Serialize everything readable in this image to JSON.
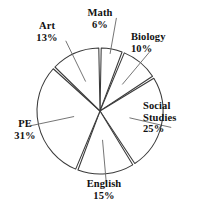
{
  "chart_data": {
    "type": "pie",
    "title": "",
    "categories": [
      "Math",
      "Biology",
      "Social Studies",
      "English",
      "PE",
      "Art"
    ],
    "values": [
      6,
      10,
      25,
      15,
      31,
      13
    ],
    "value_unit": "%",
    "start_angle_deg": 0,
    "direction": "clockwise",
    "legend": "none",
    "grid": false,
    "labels": [
      {
        "id": "math",
        "name": "Math",
        "name2": "",
        "percent": "6%",
        "value": 6,
        "start_deg": 0,
        "end_deg": 21.6
      },
      {
        "id": "biology",
        "name": "Biology",
        "name2": "",
        "percent": "10%",
        "value": 10,
        "start_deg": 21.6,
        "end_deg": 57.6
      },
      {
        "id": "social",
        "name": "Social",
        "name2": "Studies",
        "percent": "25%",
        "value": 25,
        "start_deg": 57.6,
        "end_deg": 147.6
      },
      {
        "id": "english",
        "name": "English",
        "name2": "",
        "percent": "15%",
        "value": 15,
        "start_deg": 147.6,
        "end_deg": 201.6
      },
      {
        "id": "pe",
        "name": "PE",
        "name2": "",
        "percent": "31%",
        "value": 31,
        "start_deg": 201.6,
        "end_deg": 313.2
      },
      {
        "id": "art",
        "name": "Art",
        "name2": "",
        "percent": "13%",
        "value": 13,
        "start_deg": 313.2,
        "end_deg": 360
      }
    ],
    "colors": {
      "slice_fill": "#ffffff",
      "slice_stroke": "#3a3a3a",
      "leader_line": "#6e6e6e",
      "label_text": "#111111",
      "background": "#ffffff"
    },
    "geometry": {
      "center_x": 100,
      "center_y": 111,
      "radius": 63
    }
  }
}
